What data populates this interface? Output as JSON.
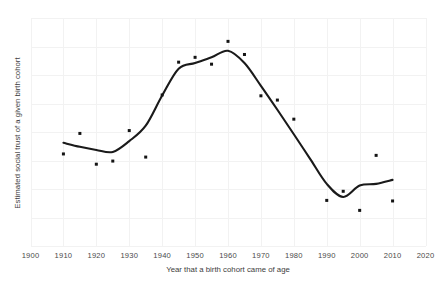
{
  "chart_data": {
    "type": "scatter",
    "title": "",
    "subtitle": "",
    "xlabel": "Year that a birth cohort came of age",
    "ylabel": "Estimated social trust of a given birth cohort",
    "xlim": [
      1900,
      2020
    ],
    "ylim": [
      0,
      8
    ],
    "grid": true,
    "legend": null,
    "xticks": [
      "1900",
      "1910",
      "1920",
      "1930",
      "1940",
      "1950",
      "1960",
      "1970",
      "1980",
      "1990",
      "2000",
      "2010",
      "2020"
    ],
    "yticks": [],
    "annotations": [],
    "series": [
      {
        "name": "Estimated social trust of a given birth cohort",
        "kind": "scatter",
        "x": [
          1910,
          1915,
          1920,
          1925,
          1930,
          1935,
          1940,
          1945,
          1950,
          1955,
          1960,
          1965,
          1970,
          1975,
          1980,
          1990,
          1995,
          2000,
          2005,
          2010
        ],
        "y": [
          3.23,
          3.95,
          2.87,
          2.98,
          4.05,
          3.12,
          5.3,
          6.45,
          6.62,
          6.38,
          7.18,
          6.72,
          5.27,
          5.12,
          4.45,
          1.6,
          1.92,
          1.25,
          3.18,
          1.58
        ]
      },
      {
        "name": "Smoothed trend",
        "kind": "line",
        "x": [
          1910,
          1915,
          1920,
          1925,
          1930,
          1935,
          1940,
          1945,
          1950,
          1955,
          1960,
          1965,
          1970,
          1975,
          1980,
          1985,
          1990,
          1995,
          2000,
          2005,
          2010
        ],
        "y": [
          3.62,
          3.48,
          3.37,
          3.3,
          3.68,
          4.22,
          5.28,
          6.22,
          6.42,
          6.62,
          6.85,
          6.42,
          5.62,
          4.78,
          3.92,
          3.05,
          2.18,
          1.72,
          2.12,
          2.18,
          2.32
        ]
      }
    ]
  }
}
